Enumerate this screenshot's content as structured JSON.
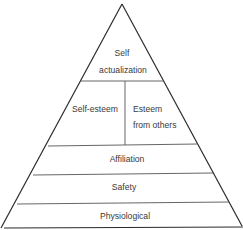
{
  "diagram": {
    "type": "hierarchy-pyramid",
    "levels": [
      {
        "id": "self-actualization",
        "lines": [
          "Self",
          "actualization"
        ]
      },
      {
        "id": "esteem",
        "parts": [
          {
            "id": "self-esteem",
            "lines": [
              "Self-esteem"
            ]
          },
          {
            "id": "esteem-from-others",
            "lines": [
              "Esteem",
              "from others"
            ]
          }
        ]
      },
      {
        "id": "affiliation",
        "lines": [
          "Affiliation"
        ]
      },
      {
        "id": "safety",
        "lines": [
          "Safety"
        ]
      },
      {
        "id": "physiological",
        "lines": [
          "Physiological"
        ]
      }
    ],
    "colors": {
      "line": "#2b2b2b",
      "text": "#3a3a3a",
      "background": "#ffffff"
    }
  },
  "labels": {
    "self_actualization_1": "Self",
    "self_actualization_2": "actualization",
    "self_esteem": "Self-esteem",
    "esteem_others_1": "Esteem",
    "esteem_others_2": "from others",
    "affiliation": "Affiliation",
    "safety": "Safety",
    "physiological": "Physiological"
  }
}
